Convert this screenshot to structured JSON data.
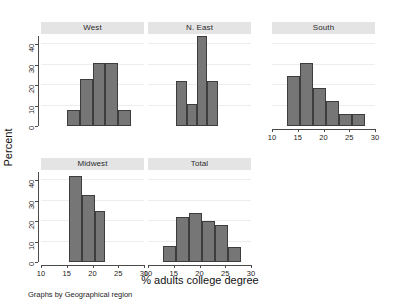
{
  "chart_data": {
    "type": "bar",
    "title": "",
    "subtitle": "",
    "xlabel": "% adults college degree",
    "ylabel": "Percent",
    "note": "Graphs by Geographical region",
    "xlim": [
      10,
      30
    ],
    "ylim": [
      0,
      44
    ],
    "xticks": [
      10,
      15,
      20,
      25,
      30
    ],
    "yticks": [
      0,
      10,
      20,
      30,
      40
    ],
    "grid": true,
    "legend": "none",
    "facet_layout": {
      "rows": 2,
      "cols": 3,
      "empty_cells": 1
    },
    "panels": [
      {
        "name": "West",
        "bin_edges": [
          15,
          17.5,
          20,
          22.5,
          25,
          27.5
        ],
        "values": [
          7.7,
          23,
          31,
          31,
          7.7
        ]
      },
      {
        "name": "N. East",
        "bin_edges": [
          15.5,
          17.5,
          19.5,
          21.5,
          23.5
        ],
        "values": [
          22,
          11,
          44,
          22
        ]
      },
      {
        "name": "South",
        "bin_edges": [
          13,
          15.5,
          18,
          20.5,
          23,
          25.5,
          28
        ],
        "values": [
          24.5,
          31,
          18.5,
          12,
          6,
          6
        ]
      },
      {
        "name": "Midwest",
        "bin_edges": [
          15.5,
          18,
          20.5,
          22.5
        ],
        "values": [
          42,
          33,
          25
        ]
      },
      {
        "name": "Total",
        "bin_edges": [
          13,
          15.5,
          18,
          20.5,
          23,
          25.5,
          28
        ],
        "values": [
          7.7,
          22,
          24,
          20,
          18,
          7.5
        ]
      }
    ]
  },
  "style": {
    "bar_fill": "#767676",
    "bar_stroke": "#3d3d3d",
    "strip_bg": "#e4e4e4",
    "axis_color": "#4a4a4a",
    "grid_color": "#ededed",
    "background": "#ffffff"
  }
}
